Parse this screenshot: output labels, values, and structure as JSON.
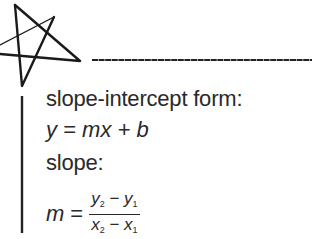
{
  "decorations": {
    "star": "hand-drawn-star-icon",
    "header_rule": "horizontal-rule",
    "margin_rule": "vertical-rule",
    "ink_color": "#1a1a1a"
  },
  "notes": {
    "slope_intercept_label": "slope-intercept form:",
    "slope_intercept_equation": "y = mx + b",
    "slope_label": "slope:",
    "slope_formula": {
      "lhs": "m",
      "equals": "=",
      "numerator": {
        "a": "y",
        "a_sub": "2",
        "op": " − ",
        "b": "y",
        "b_sub": "1"
      },
      "denominator": {
        "a": "x",
        "a_sub": "2",
        "op": " − ",
        "b": "x",
        "b_sub": "1"
      }
    }
  }
}
